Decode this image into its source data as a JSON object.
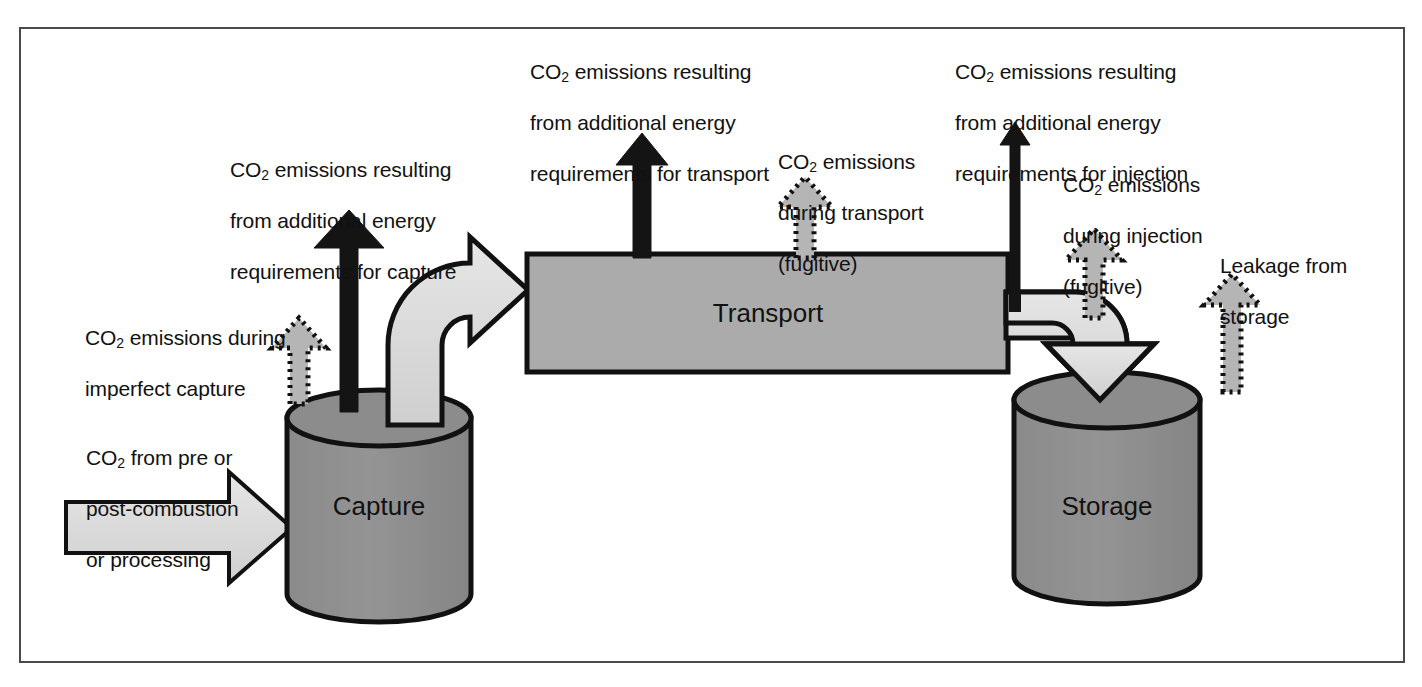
{
  "figure": {
    "background_color": "#ffffff",
    "frame_color": "#4a4a4a"
  },
  "colors": {
    "cylinder_fill": "#8c8c8c",
    "cylinder_top_fill": "#8c8c8c",
    "box_fill": "#ababab",
    "flow_arrow_fill": "#d8d8d8",
    "fugitive_arrow_fill": "#b5b5b5",
    "solid_arrow_fill": "#141414",
    "outline": "#111111"
  },
  "nodes": [
    {
      "id": "capture",
      "label": "Capture",
      "shape": "cylinder"
    },
    {
      "id": "transport",
      "label": "Transport",
      "shape": "rectangle"
    },
    {
      "id": "storage",
      "label": "Storage",
      "shape": "cylinder"
    }
  ],
  "labels": {
    "input_stream": {
      "lines": [
        "CO",
        "2",
        " from pre or",
        "post-combustion",
        "or processing"
      ],
      "line1_pre": "CO",
      "line1_sub": "2",
      "line1_post": " from pre or",
      "line2": "post-combustion",
      "line3": "or processing"
    },
    "imperfect_capture": {
      "line1_pre": "CO",
      "line1_sub": "2",
      "line1_post": " emissions during",
      "line2": "imperfect capture"
    },
    "capture_energy": {
      "line1_pre": "CO",
      "line1_sub": "2",
      "line1_post": " emissions resulting",
      "line2": "from additional energy",
      "line3": "requirements for capture"
    },
    "transport_energy": {
      "line1_pre": "CO",
      "line1_sub": "2",
      "line1_post": " emissions resulting",
      "line2": "from additional energy",
      "line3": "requirements for transport"
    },
    "transport_fugitive": {
      "line1_pre": "CO",
      "line1_sub": "2",
      "line1_post": " emissions",
      "line2": "during transport",
      "line3": "(fugitive)"
    },
    "injection_energy": {
      "line1_pre": "CO",
      "line1_sub": "2",
      "line1_post": " emissions resulting",
      "line2": "from additional energy",
      "line3": "requirements for injection"
    },
    "injection_fugitive": {
      "line1_pre": "CO",
      "line1_sub": "2",
      "line1_post": " emissions",
      "line2": "during injection",
      "line3": "(fugitive)"
    },
    "leakage_storage": {
      "line1": "Leakage from",
      "line2": "storage"
    }
  },
  "arrows": {
    "input_to_capture": {
      "style": "outlined-block",
      "direction": "right"
    },
    "capture_to_transport": {
      "style": "outlined-block-curved",
      "direction": "up-right"
    },
    "transport_to_storage": {
      "style": "outlined-block-curved",
      "direction": "right-down"
    },
    "capture_energy_emission": {
      "style": "solid-black",
      "direction": "up"
    },
    "transport_energy_emission": {
      "style": "solid-black",
      "direction": "up"
    },
    "injection_energy_emission": {
      "style": "solid-black-thin",
      "direction": "up"
    },
    "imperfect_capture_emission": {
      "style": "dotted-outline",
      "direction": "up"
    },
    "transport_fugitive_emission": {
      "style": "dotted-outline",
      "direction": "up"
    },
    "injection_fugitive_emission": {
      "style": "dotted-outline",
      "direction": "up"
    },
    "leakage_emission": {
      "style": "dotted-outline",
      "direction": "up"
    }
  }
}
